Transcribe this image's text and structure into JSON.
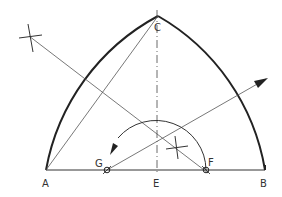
{
  "diagram": {
    "type": "geometric-construction",
    "labels": {
      "A": "A",
      "B": "B",
      "C": "C",
      "E": "E",
      "F": "F",
      "G": "G"
    },
    "colors": {
      "stroke": "#222222",
      "thin": "#555555",
      "background": "#ffffff"
    }
  }
}
